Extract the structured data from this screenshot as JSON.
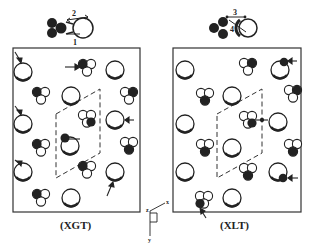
{
  "panels": [
    {
      "id": "xgt",
      "title": "(XGT)",
      "frame": {
        "x": 13,
        "y": 48,
        "w": 127,
        "h": 164
      },
      "top_molecule_labels": [
        "2",
        "1"
      ],
      "unit_cell": [
        [
          56,
          114
        ],
        [
          100,
          89
        ],
        [
          100,
          153
        ],
        [
          56,
          178
        ]
      ]
    },
    {
      "id": "xlt",
      "title": "(XLT)",
      "frame": {
        "x": 173,
        "y": 48,
        "w": 128,
        "h": 164
      },
      "top_molecule_labels": [
        "3",
        "4"
      ],
      "unit_cell": [
        [
          217,
          114
        ],
        [
          262,
          89
        ],
        [
          262,
          153
        ],
        [
          217,
          178
        ]
      ]
    }
  ],
  "axes": {
    "x_label": "x",
    "y_label": "y",
    "z_label": "z"
  },
  "colors": {
    "ink": "#222222",
    "background": "#ffffff"
  }
}
